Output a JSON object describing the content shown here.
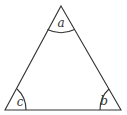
{
  "diagram": {
    "type": "triangle",
    "vertices": {
      "top": [
        61,
        6
      ],
      "bottom_right": [
        121,
        110
      ],
      "bottom_left": [
        5,
        110
      ]
    },
    "angles": [
      {
        "id": "a",
        "label": "a",
        "vertex": "top",
        "label_pos": [
          61,
          27
        ]
      },
      {
        "id": "b",
        "label": "b",
        "vertex": "bottom_right",
        "label_pos": [
          104,
          105
        ]
      },
      {
        "id": "c",
        "label": "c",
        "vertex": "bottom_left",
        "label_pos": [
          20,
          106
        ]
      }
    ],
    "colors": {
      "stroke": "#333333",
      "background": "#ffffff"
    }
  }
}
